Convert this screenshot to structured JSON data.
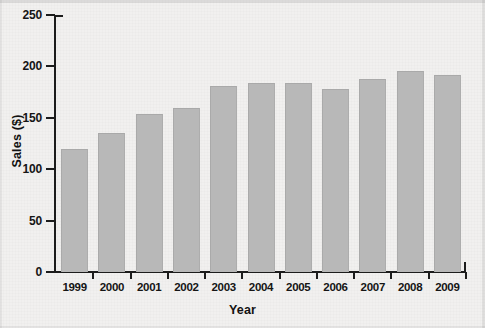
{
  "chart_data": {
    "type": "bar",
    "title": "",
    "xlabel": "Year",
    "ylabel": "Sales ($)",
    "categories": [
      "1999",
      "2000",
      "2001",
      "2002",
      "2003",
      "2004",
      "2005",
      "2006",
      "2007",
      "2008",
      "2009"
    ],
    "values": [
      120,
      135,
      154,
      160,
      181,
      184,
      184,
      178,
      188,
      196,
      192
    ],
    "ylim": [
      0,
      250
    ],
    "yticks": [
      0,
      50,
      100,
      150,
      200,
      250
    ],
    "ytick_labels": [
      "0",
      "50",
      "100",
      "150",
      "200",
      "250"
    ],
    "grid": false,
    "legend": null,
    "series": [
      {
        "name": "Sales",
        "values": [
          120,
          135,
          154,
          160,
          181,
          184,
          184,
          178,
          188,
          196,
          192
        ]
      }
    ],
    "colors": {
      "bar_fill": "#b8b8b8",
      "bar_edge": "#a9a9a9",
      "axis": "#1c1c1c",
      "text": "#151515",
      "background": "#f1f0ef"
    }
  }
}
